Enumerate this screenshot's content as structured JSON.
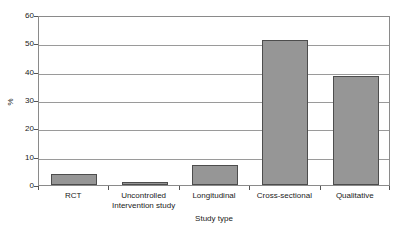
{
  "chart_data": {
    "type": "bar",
    "title": "",
    "xlabel": "Study type",
    "ylabel": "%",
    "categories": [
      "RCT",
      "Uncontrolled Intervention study",
      "Longitudinal",
      "Cross-sectional",
      "Qualitative"
    ],
    "category_lines": [
      [
        "RCT"
      ],
      [
        "Uncontrolled",
        "Intervention study"
      ],
      [
        "Longitudinal"
      ],
      [
        "Cross-sectional"
      ],
      [
        "Qualitative"
      ]
    ],
    "values": [
      3.8,
      1.0,
      7.0,
      51.2,
      38.6
    ],
    "ylim": [
      0,
      60
    ],
    "yticks": [
      0,
      10,
      20,
      30,
      40,
      50,
      60
    ],
    "ytick_labels": [
      "0",
      "10",
      "20",
      "30",
      "40",
      "50",
      "60"
    ],
    "grid": "horizontal",
    "legend": "none",
    "bar_fill_color": "#969696",
    "bar_edge_color": "#4d4d4d",
    "gridline_color": "#9a9a9a",
    "frame_color": "#8a8a8a",
    "text_color": "#1a1a1a"
  }
}
